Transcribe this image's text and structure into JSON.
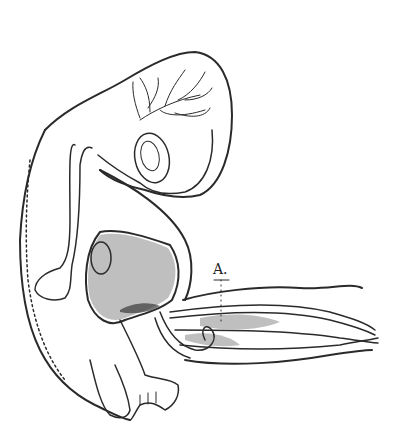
{
  "figure": {
    "labels": [
      {
        "id": "A",
        "text": "A."
      }
    ],
    "colors": {
      "ink": "#2a2a2a",
      "paper": "#ffffff"
    }
  }
}
